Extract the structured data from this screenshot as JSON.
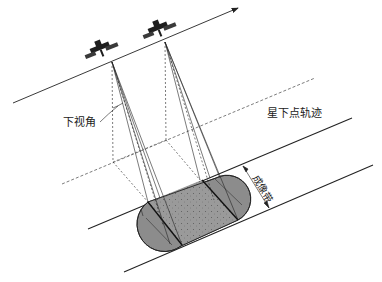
{
  "diagram": {
    "type": "satellite-imaging-geometry",
    "labels": {
      "nadir_look_angle": "下视角",
      "ground_track": "星下点轨迹",
      "imaging_swath": "成像带"
    },
    "elements": {
      "orbit": "orbit-line-with-direction-arrow",
      "satellites": [
        "satellite-1",
        "satellite-2"
      ],
      "ground_track_style": "dashed",
      "swath_edges": 2,
      "footprint": "stadium-shaped stippled region"
    },
    "colors": {
      "line": "#222222",
      "footprint_fill": "#8c8c8c",
      "footprint_center_fill": "#9a9a9a",
      "satellite": "#2a2a2a",
      "background": "#ffffff"
    }
  }
}
